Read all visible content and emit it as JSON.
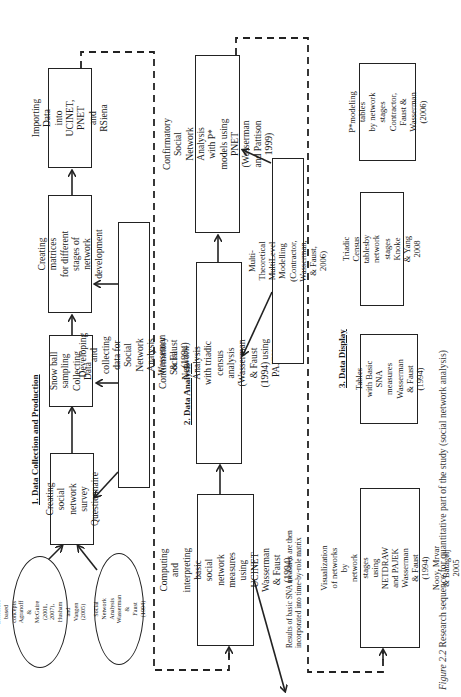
{
  "figure": {
    "caption_label": "Figure 2.2",
    "caption_text": " Research sequence for quantitative part of the study (social network analysis)",
    "orientation": "rotated 90° counter-clockwise"
  },
  "sections": [
    {
      "heading": "1. Data Collection and Production",
      "boxes": {
        "importing": "Importing Data\ninto UCINET, PNET\nand RSiena",
        "matrices": "Creating matrices\nfor different stages of\nnetwork development",
        "snowball": "Snow ball\nsampling\nCollecting Data",
        "survey": "Creating social\nnetwork survey\nQuestionnaire",
        "developing": "Developing and collecting data for Social Network Analysis\nWasseman & Faust (1994)"
      },
      "ellipses": {
        "literature": "Literature\nbased concepts\nAgranoff & McGuire\n(2001, 2007),\nHusham and Vangen\n(2005)",
        "sna": "Social Network\nAnalysis\nWasserman &\nFaust (1994)"
      }
    },
    {
      "heading": "2. Data Analysis",
      "boxes": {
        "confirmatory_pstar": "Confirmatory Social Network\nAnalysis  with P* models using PNET\n(Wasserman and Pattison 1999)",
        "confirmatory_triadic": "Confirmatory Social Network Analysis\nwith  triadic census analysis\n(Wasserman & Faust (1994) using PAJEK",
        "multitheoretical": "Multi-Theoretical MultiLevel Modelling\n(Contractor, Wasserman, & Faust, 2006)",
        "computing": "Computing and interpreting basic\nsocial network measures\nusing UCINET\nWasserman & Faust (1994)"
      },
      "note": "Results of basic SNA measures are then\nincorporated into time-by-role matrix"
    },
    {
      "heading": "3. Data Display",
      "boxes": {
        "pstar_tables": "P*modeling  tables\nby network stages\nContractor, Faust &\nWasserman  (2006)",
        "triadic_tables": "Triadic Census tablesby\nnetwork stages\nKnoke & Yang 2008",
        "basic_tables": "Tables with Basic SNA\nmeasures\nWasserman & Faust\n(1994)",
        "visualization": "Visualization of networks by\nnetwork stages\nusing NETDRAW and PAJEK\nWasserman & Faust (1994)\nNooy, Mrvar & Batagelj 2005"
      }
    }
  ]
}
